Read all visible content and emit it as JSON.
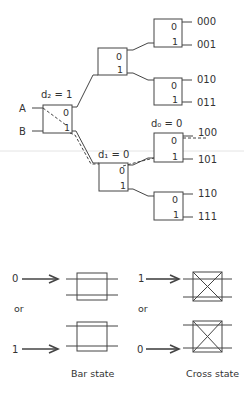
{
  "network": {
    "inputs": [
      "A",
      "B"
    ],
    "stage_labels": {
      "d2": "d₂ = 1",
      "d1": "d₁ = 0",
      "d0": "d₀ = 0"
    },
    "port_labels": {
      "top": "0",
      "bottom": "1"
    },
    "outputs": [
      "000",
      "001",
      "010",
      "011",
      "100",
      "101",
      "110",
      "111"
    ],
    "routed_path": "A → 1 → 0 → 0 = 100"
  },
  "legend": {
    "bar_inputs": [
      "0",
      "1"
    ],
    "cross_inputs": [
      "1",
      "0"
    ],
    "or_label": "or",
    "bar_caption": "Bar state",
    "cross_caption": "Cross state"
  }
}
